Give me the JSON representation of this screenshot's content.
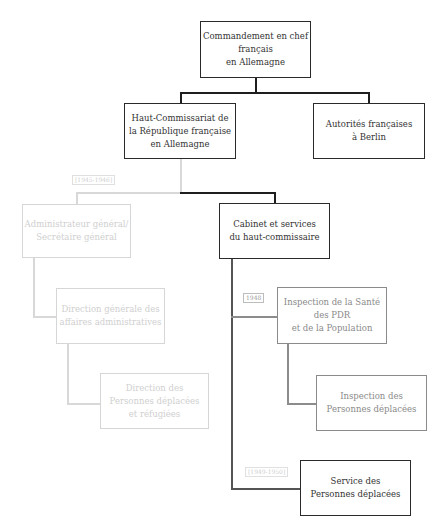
{
  "page": {
    "running_header": "",
    "page_number": ""
  },
  "nodes": {
    "commandement": "Commandement en chef\nfrançais\nen Allemagne",
    "haut_commissariat": "Haut-Commissariat de\nla République française\nen Allemagne",
    "autorites_berlin": "Autorités françaises\nà Berlin",
    "cabinet": "Cabinet et services\ndu haut-commissaire",
    "administrateur": "Administrateur général/\nSecrétaire général",
    "direction_generale": "Direction générale des\naffaires administratives",
    "direction_personnes": "Direction des\nPersonnes déplacées\net réfugiées",
    "inspection_sante": "Inspection de la Santé\ndes PDR\net de la Population",
    "inspection_personnes": "Inspection des\nPersonnes déplacées",
    "service_personnes": "Service des\nPersonnes déplacées"
  },
  "tags": {
    "period_1": "[1945-1946]",
    "period_2": "1948",
    "period_3": "[1949-1950]"
  }
}
